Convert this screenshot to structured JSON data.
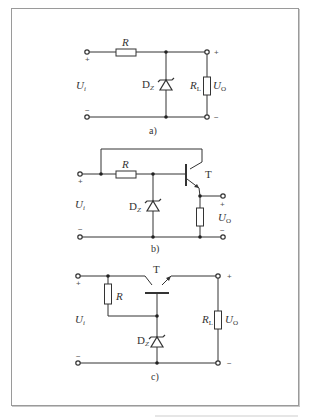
{
  "figure": {
    "circuits": [
      {
        "id": "a",
        "caption": "a)",
        "labels": {
          "resistor": "R",
          "input_voltage": "U",
          "input_voltage_sub": "i",
          "zener": "D",
          "zener_sub": "Z",
          "load": "R",
          "load_sub": "L",
          "output_voltage": "U",
          "output_voltage_sub": "O",
          "in_plus": "+",
          "in_minus": "−",
          "out_plus": "+",
          "out_minus": "−"
        }
      },
      {
        "id": "b",
        "caption": "b)",
        "labels": {
          "resistor": "R",
          "transistor": "T",
          "input_voltage": "U",
          "input_voltage_sub": "i",
          "zener": "D",
          "zener_sub": "Z",
          "output_voltage": "U",
          "output_voltage_sub": "O",
          "in_plus": "+",
          "in_minus": "−",
          "out_plus": "+",
          "out_minus": "−"
        }
      },
      {
        "id": "c",
        "caption": "c)",
        "labels": {
          "resistor": "R",
          "transistor": "T",
          "input_voltage": "U",
          "input_voltage_sub": "i",
          "zener": "D",
          "zener_sub": "Z",
          "load": "R",
          "load_sub": "L",
          "output_voltage": "U",
          "output_voltage_sub": "O",
          "in_plus": "+",
          "in_minus": "−",
          "out_plus": "+",
          "out_minus": "−"
        }
      }
    ]
  }
}
